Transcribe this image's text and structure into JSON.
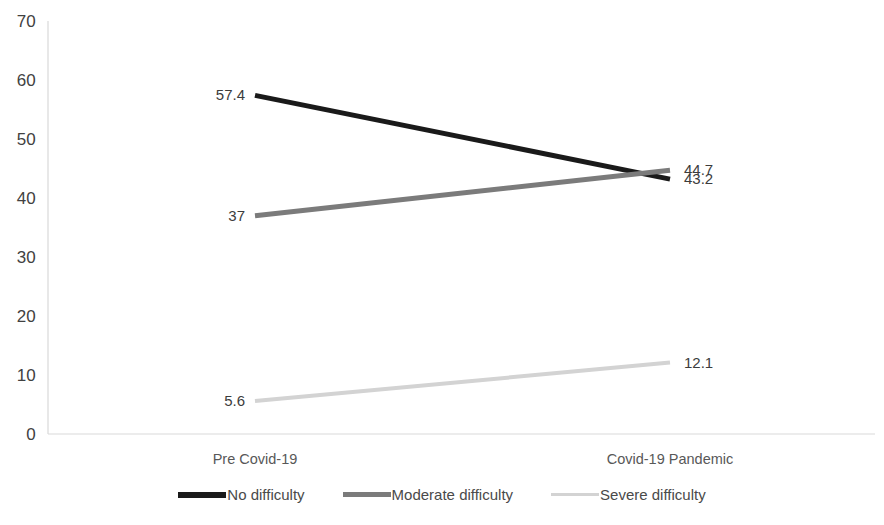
{
  "chart_data": {
    "type": "line",
    "title": "",
    "subtitle": "",
    "xlabel": "",
    "ylabel": "",
    "categories": [
      "Pre Covid-19",
      "Covid-19 Pandemic"
    ],
    "x": [
      0,
      1
    ],
    "ylim": [
      0,
      70
    ],
    "y_ticks": [
      0,
      10,
      20,
      30,
      40,
      50,
      60,
      70
    ],
    "y_tick_labels": [
      "0",
      "10",
      "20",
      "30",
      "40",
      "50",
      "60",
      "70"
    ],
    "grid": false,
    "legend_position": "bottom",
    "series": [
      {
        "name": "No difficulty",
        "values": [
          57.4,
          43.2
        ],
        "labels": [
          "57.4",
          "43.2"
        ],
        "color": "#1a1a1a",
        "line_width": 5
      },
      {
        "name": "Moderate difficulty",
        "values": [
          37,
          44.7
        ],
        "labels": [
          "37",
          "44.7"
        ],
        "color": "#7b7b7b",
        "line_width": 5
      },
      {
        "name": "Severe difficulty",
        "values": [
          5.6,
          12.1
        ],
        "labels": [
          "5.6",
          "12.1"
        ],
        "color": "#d3d3d3",
        "line_width": 4
      }
    ],
    "axis_color": "#d9d9d9",
    "text_color": "#404040"
  },
  "legend": {
    "items": [
      {
        "label": "No difficulty"
      },
      {
        "label": "Moderate difficulty"
      },
      {
        "label": "Severe difficulty"
      }
    ]
  },
  "bottom_ghost_text": ""
}
